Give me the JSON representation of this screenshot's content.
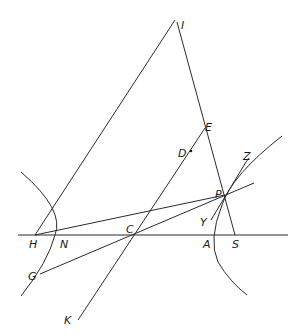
{
  "diagram": {
    "type": "geometric-construction",
    "points": {
      "I": {
        "label": "I",
        "x": 175,
        "y": 20
      },
      "E": {
        "label": "E",
        "x": 205,
        "y": 128
      },
      "D": {
        "label": "D",
        "x": 190,
        "y": 151
      },
      "Z": {
        "label": "Z",
        "x": 248,
        "y": 160
      },
      "P": {
        "label": "P",
        "x": 225,
        "y": 196
      },
      "Y": {
        "label": "Y",
        "x": 211,
        "y": 220
      },
      "H": {
        "label": "H",
        "x": 35,
        "y": 235
      },
      "N": {
        "label": "N",
        "x": 55,
        "y": 235
      },
      "C": {
        "label": "C",
        "x": 134,
        "y": 235
      },
      "A": {
        "label": "A",
        "x": 213,
        "y": 235
      },
      "S": {
        "label": "S",
        "x": 235,
        "y": 235
      },
      "G": {
        "label": "G",
        "x": 40,
        "y": 274
      },
      "K": {
        "label": "K",
        "x": 78,
        "y": 320
      }
    },
    "labels": {
      "I": "I",
      "E": "E",
      "D": "D",
      "Z": "Z",
      "P": "P",
      "Y": "Y",
      "H": "H",
      "N": "N",
      "C": "C",
      "A": "A",
      "S": "S",
      "G": "G",
      "K": "K"
    },
    "segments": [
      {
        "name": "baseline",
        "from": "left-end",
        "to": "right-end"
      },
      {
        "name": "HI",
        "from": "H",
        "to": "I"
      },
      {
        "name": "IS",
        "from": "I",
        "to": "S"
      },
      {
        "name": "KE",
        "from": "K",
        "to": "E"
      },
      {
        "name": "GP-extended",
        "from": "G",
        "to": "P"
      },
      {
        "name": "HP-extended",
        "from": "H",
        "to": "P"
      },
      {
        "name": "tangent-YZ",
        "from": "Y",
        "to": "Z"
      }
    ],
    "curves": [
      {
        "name": "left-branch",
        "vertex": "N"
      },
      {
        "name": "right-branch",
        "vertex": "A"
      }
    ]
  }
}
